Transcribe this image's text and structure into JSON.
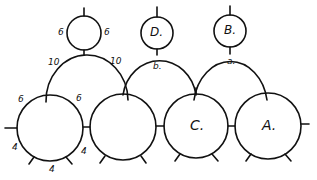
{
  "diagram": {
    "type": "hand-drawn circle/arch linkage diagram",
    "stroke_color": "#111111",
    "background": "#ffffff",
    "top_circles": [
      {
        "id": "top-left",
        "label": "",
        "side_labels": [
          "6",
          "6"
        ]
      },
      {
        "id": "top-d",
        "label": "D."
      },
      {
        "id": "top-b",
        "label": "B."
      }
    ],
    "arches": [
      {
        "id": "arch-left",
        "labels": [
          "10",
          "10"
        ]
      },
      {
        "id": "arch-middle",
        "label": "b."
      },
      {
        "id": "arch-right",
        "label": "a."
      }
    ],
    "bottom_circles": [
      {
        "id": "bottom-1",
        "label": "",
        "side_labels": [
          "6",
          "6"
        ],
        "bottom_labels": [
          "4",
          "4",
          "4"
        ]
      },
      {
        "id": "bottom-2",
        "label": ""
      },
      {
        "id": "bottom-3",
        "label": "C."
      },
      {
        "id": "bottom-4",
        "label": "A."
      }
    ]
  }
}
